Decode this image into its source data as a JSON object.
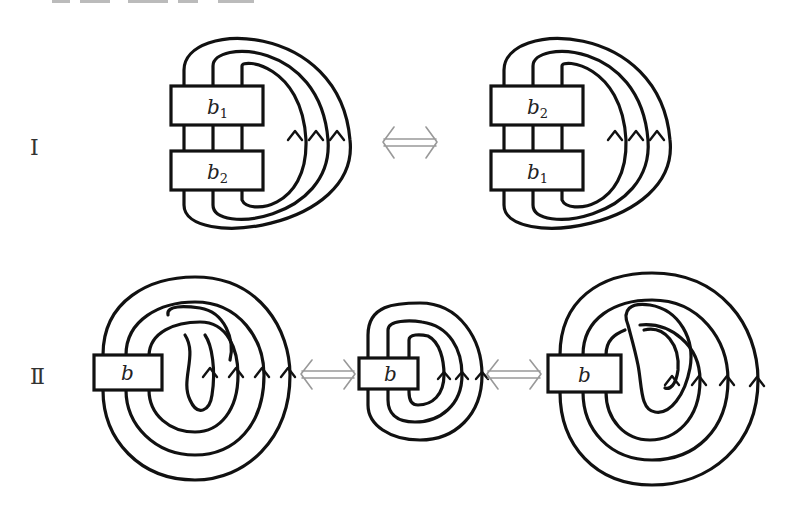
{
  "figure": {
    "top_fragment_note": "cut-off caption text at top edge (illegible)",
    "rows": [
      {
        "label": "Ⅰ",
        "diagrams": [
          {
            "id": "I-left",
            "boxes": [
              {
                "label": "b",
                "sub": "1"
              },
              {
                "label": "b",
                "sub": "2"
              }
            ],
            "strands": 3
          },
          {
            "id": "I-right",
            "boxes": [
              {
                "label": "b",
                "sub": "2"
              },
              {
                "label": "b",
                "sub": "1"
              }
            ],
            "strands": 3
          }
        ],
        "equivalences": [
          "⟺"
        ]
      },
      {
        "label": "Ⅱ",
        "diagrams": [
          {
            "id": "II-left",
            "boxes": [
              {
                "label": "b"
              }
            ],
            "strands": 4,
            "note": "extra kink loop"
          },
          {
            "id": "II-middle",
            "boxes": [
              {
                "label": "b"
              }
            ],
            "strands": 3
          },
          {
            "id": "II-right",
            "boxes": [
              {
                "label": "b"
              }
            ],
            "strands": 4,
            "note": "extra kink loop (opposite)"
          }
        ],
        "equivalences": [
          "⟺",
          "⟺"
        ]
      }
    ]
  },
  "colors": {
    "stroke": "#111111",
    "equiv_arrow": "#999999",
    "background": "#ffffff"
  }
}
